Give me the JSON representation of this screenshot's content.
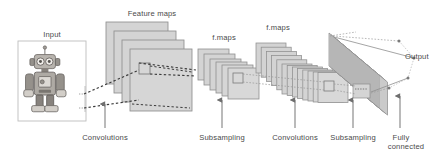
{
  "figure": {
    "type": "diagram",
    "width": 446,
    "height": 158,
    "background": "#ffffff"
  },
  "colors": {
    "text": "#4a4a4a",
    "map_fill": "#d2d2d2",
    "map_fill_light": "#dcdcdc",
    "map_stroke": "#8c8c8c",
    "input_box_stroke": "#b9b9b9",
    "dotted_line": "#3a3a3a",
    "thin_dotted": "#9a9a9a",
    "arrow": "#6e6e6e",
    "output_line": "#8e8e8e",
    "robot_body": "#9a958f",
    "robot_dark": "#55514d",
    "robot_light": "#cfcac4"
  },
  "labels": {
    "input": "Input",
    "feature_maps": "Feature maps",
    "fmaps_2": "f.maps",
    "fmaps_3": "f.maps",
    "output": "Output"
  },
  "operations": [
    {
      "label": "Convolutions",
      "x": 105,
      "arrow_x": 105,
      "arrow_top": 104,
      "arrow_bottom": 128
    },
    {
      "label": "Subsampling",
      "x": 222,
      "arrow_x": 222,
      "arrow_top": 100,
      "arrow_bottom": 128
    },
    {
      "label": "Convolutions",
      "x": 295,
      "arrow_x": 295,
      "arrow_top": 100,
      "arrow_bottom": 128
    },
    {
      "label": "Subsampling",
      "x": 353,
      "arrow_x": 353,
      "arrow_top": 100,
      "arrow_bottom": 128
    },
    {
      "label": "Fully",
      "label_line2": "connected",
      "x": 400,
      "arrow_x": 400,
      "arrow_top": 96,
      "arrow_bottom": 128
    }
  ],
  "layers": {
    "input_box": {
      "x": 18,
      "y": 41,
      "width": 68,
      "height": 80,
      "label": "Input"
    },
    "feature_maps_1": {
      "label": "Feature maps",
      "count": 4,
      "size": 62,
      "origin_x": 106,
      "origin_y": 22,
      "offset_x": 8,
      "offset_y": 9,
      "receptive_field": {
        "x": 138,
        "y": 64,
        "size": 11
      }
    },
    "fmaps_2": {
      "label": "f.maps",
      "count": 6,
      "size": 31,
      "origin_x": 198,
      "origin_y": 49,
      "offset_x": 6,
      "offset_y": 5,
      "receptive_field": {
        "x": 226,
        "y": 72,
        "size": 10
      }
    },
    "fmaps_3": {
      "label": "f.maps",
      "count": 14,
      "size": 30,
      "origin_x": 256,
      "origin_y": 43,
      "offset_x": 5.2,
      "offset_y": 4.2,
      "receptive_field": {
        "x": 322,
        "y": 82,
        "size": 10
      }
    },
    "fully_connected": {
      "count": 26,
      "width": 9,
      "height": 38,
      "origin_x": 328,
      "origin_y": 34,
      "offset_x": 2.0,
      "offset_y": 2.2
    },
    "output_nodes": {
      "label": "Output",
      "count": 4,
      "points": [
        {
          "x": 399,
          "y": 41
        },
        {
          "x": 414,
          "y": 58
        },
        {
          "x": 408,
          "y": 78
        },
        {
          "x": 389,
          "y": 88
        }
      ]
    }
  }
}
